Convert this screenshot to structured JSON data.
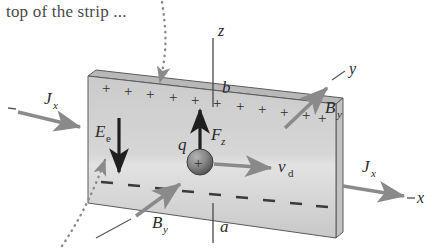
{
  "figure": {
    "kind": "hall-effect-diagram",
    "caption_text": "top of the strip ...",
    "labels": {
      "axis_z": "z",
      "axis_y": "y",
      "axis_x": "x",
      "edge_top": "b",
      "edge_bottom": "a",
      "current_density_left": "J",
      "current_density_left_sub": "x",
      "current_density_right": "J",
      "current_density_right_sub": "x",
      "electric_field": "E",
      "electric_field_sub": "e",
      "force": "F",
      "force_sub": "z",
      "charge": "q",
      "drift_velocity": "v",
      "drift_velocity_sub": "d",
      "magnetic_field_top": "B",
      "magnetic_field_top_sub": "y",
      "magnetic_field_bottom": "B",
      "magnetic_field_bottom_sub": "y",
      "charge_sphere_sign": "+",
      "stray_minus_left": "–",
      "stray_dash_x": "–"
    },
    "charges": {
      "positive_sign": "+",
      "positive_count": 12,
      "negative_sign": "–",
      "negative_count": 9
    },
    "colors": {
      "slab_face": "#cfcfcf",
      "slab_top_edge": "#b3b3b3",
      "slab_right_edge": "#bdbdbd",
      "outline": "#555555",
      "arrow_gray": "#8a8a8a",
      "arrow_dark": "#1f1f1f",
      "dotted": "#8a8a8a",
      "text": "#2b2b2b",
      "caption_text": "#4a4a4a",
      "background": "#ffffff",
      "sphere_dark": "#5a5a5a",
      "sphere_light": "#a8a8a8"
    }
  }
}
